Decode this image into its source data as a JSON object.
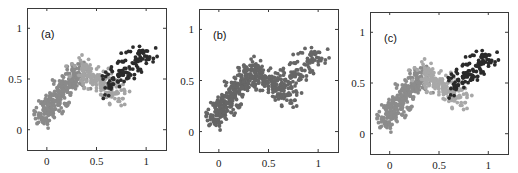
{
  "chart_data": [
    {
      "type": "scatter",
      "panel_label": "(a)",
      "title": "",
      "xlabel": "",
      "ylabel": "",
      "xlim": [
        -0.2,
        1.2
      ],
      "ylim": [
        -0.2,
        1.2
      ],
      "xticks": [
        0,
        0.5,
        1
      ],
      "xtick_labels": [
        "0",
        "0.5",
        "1"
      ],
      "yticks": [
        0,
        0.5,
        1
      ],
      "ytick_labels": [
        "0",
        "0.5",
        "1"
      ],
      "grid": false,
      "legend": null,
      "description": "Noisy N-shaped point cloud colored by cluster membership (3 clusters)",
      "series": [
        {
          "name": "cluster-1",
          "color": "#8a8a8a",
          "n": 300,
          "segment": [
            [
              -0.05,
              0.12
            ],
            [
              0.33,
              0.6
            ]
          ],
          "spread": 0.06
        },
        {
          "name": "cluster-2",
          "color": "#a4a4a4",
          "n": 170,
          "segment": [
            [
              0.33,
              0.62
            ],
            [
              0.72,
              0.32
            ]
          ],
          "spread": 0.06
        },
        {
          "name": "cluster-3",
          "color": "#2b2b2b",
          "n": 120,
          "segment": [
            [
              0.62,
              0.45
            ],
            [
              1.02,
              0.78
            ]
          ],
          "spread": 0.06
        }
      ]
    },
    {
      "type": "scatter",
      "panel_label": "(b)",
      "title": "",
      "xlabel": "",
      "ylabel": "",
      "xlim": [
        -0.2,
        1.2
      ],
      "ylim": [
        -0.2,
        1.2
      ],
      "xticks": [
        0,
        0.5,
        1
      ],
      "xtick_labels": [
        "0",
        "0.5",
        "1"
      ],
      "yticks": [
        0,
        0.5,
        1
      ],
      "ytick_labels": [
        "0",
        "0.5",
        "1"
      ],
      "grid": false,
      "legend": null,
      "description": "Same noisy N-shaped data, unlabeled (single color)",
      "series": [
        {
          "name": "all-points",
          "color": "#666666",
          "n": 300,
          "segment": [
            [
              -0.05,
              0.12
            ],
            [
              0.33,
              0.6
            ]
          ],
          "spread": 0.06
        },
        {
          "name": "all-points",
          "color": "#666666",
          "n": 170,
          "segment": [
            [
              0.33,
              0.62
            ],
            [
              0.72,
              0.32
            ]
          ],
          "spread": 0.06
        },
        {
          "name": "all-points",
          "color": "#666666",
          "n": 120,
          "segment": [
            [
              0.62,
              0.45
            ],
            [
              1.02,
              0.78
            ]
          ],
          "spread": 0.06
        }
      ]
    },
    {
      "type": "scatter",
      "panel_label": "(c)",
      "title": "",
      "xlabel": "",
      "ylabel": "",
      "xlim": [
        -0.2,
        1.2
      ],
      "ylim": [
        -0.2,
        1.2
      ],
      "xticks": [
        0,
        0.5,
        1
      ],
      "xtick_labels": [
        "0",
        "0.5",
        "1"
      ],
      "yticks": [
        0,
        0.5,
        1
      ],
      "ytick_labels": [
        "0",
        "0.5",
        "1"
      ],
      "grid": false,
      "legend": null,
      "description": "Same data colored by recovered clusters (3 clusters)",
      "series": [
        {
          "name": "cluster-1",
          "color": "#8c8c8c",
          "n": 300,
          "segment": [
            [
              -0.05,
              0.12
            ],
            [
              0.33,
              0.6
            ]
          ],
          "spread": 0.06
        },
        {
          "name": "cluster-2",
          "color": "#a8a8a8",
          "n": 170,
          "segment": [
            [
              0.33,
              0.62
            ],
            [
              0.72,
              0.32
            ]
          ],
          "spread": 0.06
        },
        {
          "name": "cluster-3",
          "color": "#2a2a2a",
          "n": 120,
          "segment": [
            [
              0.65,
              0.48
            ],
            [
              1.02,
              0.78
            ]
          ],
          "spread": 0.055
        }
      ]
    }
  ],
  "panels": [
    {
      "label": "(a)",
      "left": 27,
      "top": 8,
      "width": 139,
      "height": 142
    },
    {
      "label": "(b)",
      "left": 199,
      "top": 9,
      "width": 139,
      "height": 143
    },
    {
      "label": "(c)",
      "left": 370,
      "top": 12,
      "width": 138,
      "height": 142
    }
  ]
}
